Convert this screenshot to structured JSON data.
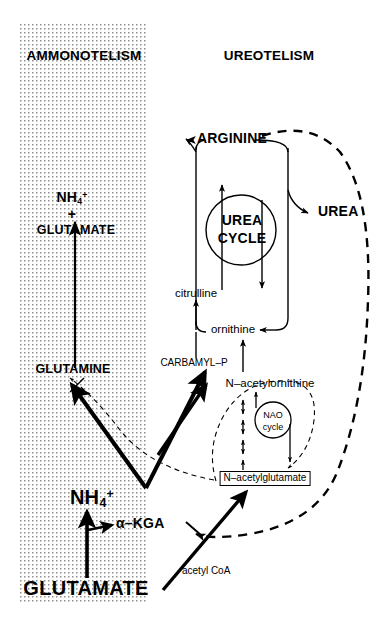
{
  "figure": {
    "type": "biochemical-pathway-diagram",
    "headings": {
      "left": "AMMONOTELISM",
      "right": "UREOTELISM"
    },
    "left_pathway": {
      "substrate_line1": "NH",
      "substrate_sub": "4",
      "substrate_sup": "+",
      "plus": "+",
      "glutamate": "GLUTAMATE",
      "glutamine": "GLUTAMINE"
    },
    "urea_cycle": {
      "center_line1": "UREA",
      "center_line2": "CYCLE",
      "arginine": "ARGININE",
      "citrulline": "citrulline",
      "ornithine": "ornithine",
      "urea": "UREA",
      "carbamyl_p": "CARBAMYL–P"
    },
    "nao_cycle": {
      "center_line1": "NAO",
      "center_line2": "cycle",
      "n_acetylornithine": "N–acetylornithine",
      "n_acetylglutamate": "N–acetylglutamate"
    },
    "bottom": {
      "ammonium": "NH",
      "ammonium_sub": "4",
      "ammonium_sup": "+",
      "glutamate": "GLUTAMATE",
      "alpha_kga": "α–KGA",
      "acetyl_coa": "acetyl CoA"
    },
    "colors": {
      "ink": "#000000",
      "paper": "#ffffff",
      "stipple": "#9a9a9a"
    }
  }
}
